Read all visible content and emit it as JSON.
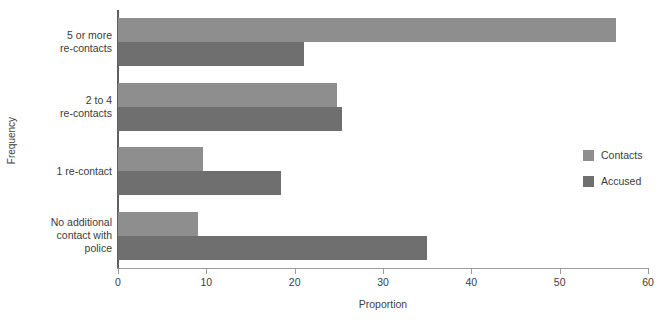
{
  "chart_data": {
    "type": "bar",
    "orientation": "horizontal",
    "title": "",
    "xlabel": "Proportion",
    "ylabel": "Frequency",
    "xlim": [
      0,
      60
    ],
    "xticks": [
      0,
      10,
      20,
      30,
      40,
      50,
      60
    ],
    "grid": false,
    "legend_position": "right",
    "categories": [
      "No additional contact with police",
      "1 re-contact",
      "2 to 4 re-contacts",
      "5 or more re-contacts"
    ],
    "category_lines": [
      [
        "No additional",
        "contact with",
        "police"
      ],
      [
        "1 re-contact"
      ],
      [
        "2 to 4",
        "re-contacts"
      ],
      [
        "5 or more",
        "re-contacts"
      ]
    ],
    "series": [
      {
        "name": "Contacts",
        "color": "#8e8e8e",
        "values": [
          9.1,
          9.6,
          24.8,
          56.4
        ]
      },
      {
        "name": "Accused",
        "color": "#6f6f6f",
        "values": [
          35.0,
          18.4,
          25.4,
          21.0
        ]
      }
    ]
  },
  "legend": {
    "items": [
      {
        "label": "Contacts",
        "color": "#8e8e8e"
      },
      {
        "label": "Accused",
        "color": "#6f6f6f"
      }
    ]
  },
  "axis": {
    "x_title": "Proportion",
    "y_title": "Frequency",
    "x_tick_labels": [
      "0",
      "10",
      "20",
      "30",
      "40",
      "50",
      "60"
    ]
  }
}
